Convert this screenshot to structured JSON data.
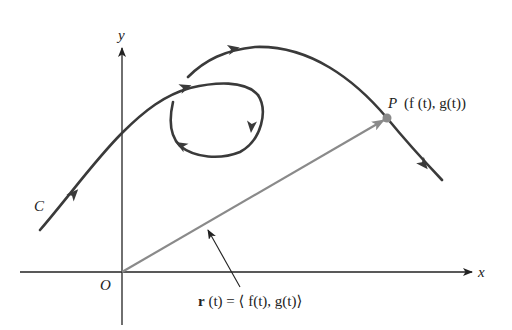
{
  "diagram": {
    "type": "parametric-curve-vector-diagram",
    "colors": {
      "curve": "#3a3a3a",
      "axis": "#222222",
      "vector": "#8a8a8a",
      "point": "#8a8a8a",
      "background": "#ffffff"
    },
    "axes": {
      "x_label": "x",
      "y_label": "y",
      "origin_label": "O"
    },
    "curve": {
      "label": "C",
      "direction_arrows": 5
    },
    "point": {
      "name": "P",
      "coords_label": "(f (t), g(t))"
    },
    "vector": {
      "label_prefix": "r",
      "label_rest": " (t) = ⟨ f(t), g(t)⟩"
    }
  }
}
